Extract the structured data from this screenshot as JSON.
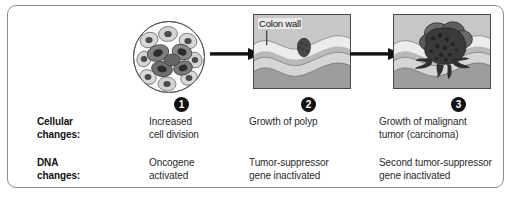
{
  "figure": {
    "border_color": "#8d8d8d"
  },
  "stages": [
    {
      "number": "1",
      "marker_name": "step-marker-1",
      "illustration": "cell-cluster-circle",
      "cellular_change": "Increased\ncell division",
      "cellular_change_line1": "Increased",
      "cellular_change_line2": "cell division",
      "dna_change_line1": "Oncogene",
      "dna_change_line2": "activated"
    },
    {
      "number": "2",
      "marker_name": "step-marker-2",
      "illustration": "colon-wall-polyp",
      "annotation": "Colon wall",
      "cellular_change_line1": "Growth of polyp",
      "cellular_change_line2": "",
      "dna_change_line1": "Tumor-suppressor",
      "dna_change_line2": "gene inactivated"
    },
    {
      "number": "3",
      "marker_name": "step-marker-3",
      "illustration": "colon-wall-malignant-tumor",
      "cellular_change_line1": "Growth of malignant",
      "cellular_change_line2": "tumor (carcinoma)",
      "dna_change_line1": "Second tumor-suppressor",
      "dna_change_line2": "gene inactivated"
    }
  ],
  "rows": {
    "cellular": {
      "label_line1": "Cellular",
      "label_line2": "changes:"
    },
    "dna": {
      "label_line1": "DNA",
      "label_line2": "changes:"
    }
  },
  "colors": {
    "frame": "#8d8d8d",
    "marker_fill": "#111111",
    "marker_text": "#ffffff",
    "text": "#2a2a2a",
    "label_text": "#111111",
    "arrow": "#111111",
    "scene_background": "#c9c9c9",
    "tumor_dark": "#3e3e3e",
    "wall_light": "#eceaea",
    "wall_mid": "#b5b5b5",
    "wall_dark": "#8f8f8f"
  }
}
